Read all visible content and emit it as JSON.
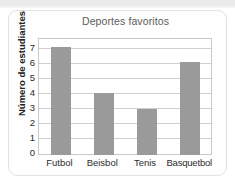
{
  "figure": {
    "title": "Deportes favoritos"
  },
  "chart_data": {
    "type": "bar",
    "title": "Deportes favoritos",
    "xlabel": "",
    "ylabel": "Número de estudiantes",
    "categories": [
      "Futbol",
      "Beisbol",
      "Tenis",
      "Basquetbol"
    ],
    "values": [
      7,
      4,
      3,
      6
    ],
    "ylim": [
      0,
      7.5
    ],
    "yticks": [
      0,
      1,
      2,
      3,
      4,
      5,
      6,
      7
    ],
    "ytick_labels": [
      "0",
      "1",
      "2",
      "3",
      "4",
      "5",
      "6",
      "7"
    ],
    "grid": "horizontal",
    "legend": "none",
    "bar_color": "#9a9a9a",
    "axis_color": "#c9c9c9",
    "gridline_color": "#cfcfcf",
    "title_color": "#5c5c5c",
    "label_color": "#222222"
  }
}
